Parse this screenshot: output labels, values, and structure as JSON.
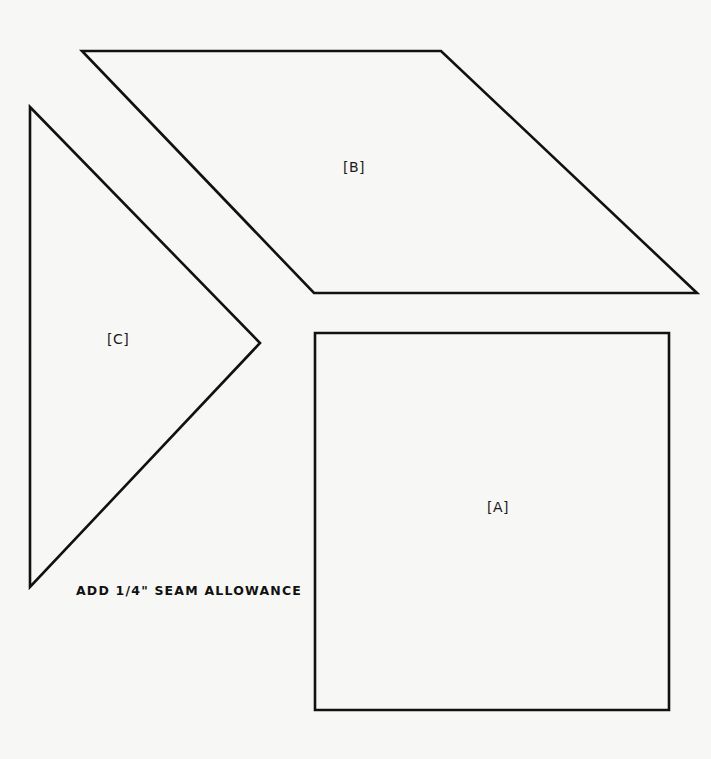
{
  "diagram": {
    "type": "quilt-pattern-templates",
    "caption": "ADD 1/4\" SEAM ALLOWANCE",
    "colors": {
      "background": "#f7f7f5",
      "outline": "#111111",
      "text": "#1a1a1a"
    },
    "pieces": [
      {
        "id": "A",
        "label": "[A]",
        "shape": "square",
        "points": "315,333 669,333 669,710 315,710"
      },
      {
        "id": "B",
        "label": "[B]",
        "shape": "parallelogram",
        "points": "82,51 441,51 697,293 314,293"
      },
      {
        "id": "C",
        "label": "[C]",
        "shape": "right-triangle",
        "points": "30,107 260,343 30,587"
      }
    ]
  }
}
